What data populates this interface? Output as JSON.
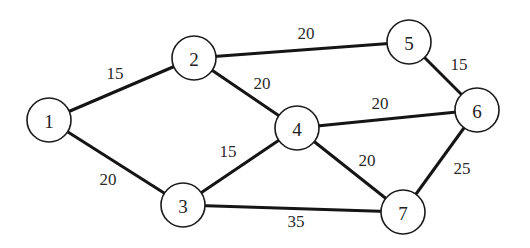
{
  "diagram": {
    "type": "weighted-undirected-graph",
    "nodes": [
      {
        "id": "1",
        "label": "1",
        "x": 49,
        "y": 120
      },
      {
        "id": "2",
        "label": "2",
        "x": 194,
        "y": 58
      },
      {
        "id": "3",
        "label": "3",
        "x": 183,
        "y": 205
      },
      {
        "id": "4",
        "label": "4",
        "x": 297,
        "y": 128
      },
      {
        "id": "5",
        "label": "5",
        "x": 409,
        "y": 42
      },
      {
        "id": "6",
        "label": "6",
        "x": 477,
        "y": 110
      },
      {
        "id": "7",
        "label": "7",
        "x": 403,
        "y": 212
      }
    ],
    "edges": [
      {
        "from": "1",
        "to": "2",
        "weight": "15",
        "lx": 115,
        "ly": 73
      },
      {
        "from": "1",
        "to": "3",
        "weight": "20",
        "lx": 108,
        "ly": 179
      },
      {
        "from": "2",
        "to": "5",
        "weight": "20",
        "lx": 306,
        "ly": 33
      },
      {
        "from": "2",
        "to": "4",
        "weight": "20",
        "lx": 262,
        "ly": 83
      },
      {
        "from": "3",
        "to": "4",
        "weight": "15",
        "lx": 228,
        "ly": 151
      },
      {
        "from": "3",
        "to": "7",
        "weight": "35",
        "lx": 296,
        "ly": 221
      },
      {
        "from": "4",
        "to": "6",
        "weight": "20",
        "lx": 380,
        "ly": 103
      },
      {
        "from": "4",
        "to": "7",
        "weight": "20",
        "lx": 367,
        "ly": 160
      },
      {
        "from": "5",
        "to": "6",
        "weight": "15",
        "lx": 459,
        "ly": 64
      },
      {
        "from": "6",
        "to": "7",
        "weight": "25",
        "lx": 462,
        "ly": 168
      }
    ],
    "node_radius": 22
  }
}
